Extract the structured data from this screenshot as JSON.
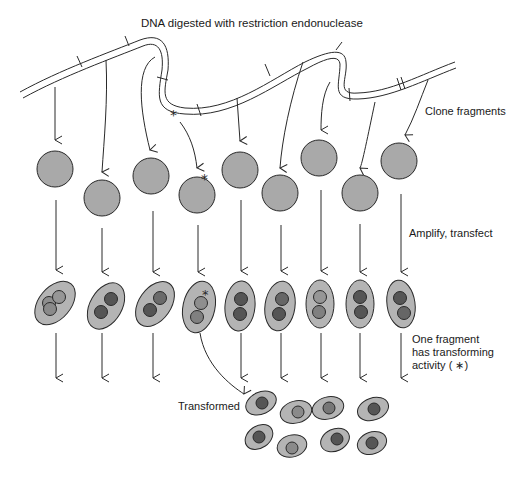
{
  "title": "DNA digested with restriction endonuclease",
  "labels": {
    "clone": "Clone fragments",
    "amplify": "Amplify, transfect",
    "one_fragment_1": "One fragment",
    "one_fragment_2": "has transforming",
    "one_fragment_3": "activity ( ∗)",
    "transformed": "Transformed"
  },
  "marker": "*",
  "colors": {
    "line": "#2a2a2a",
    "circle_fill": "#a9a9a9",
    "cell_fill": "#b4b4b4",
    "nucleus_light": "#8e8e8e",
    "nucleus_dark": "#555555"
  }
}
